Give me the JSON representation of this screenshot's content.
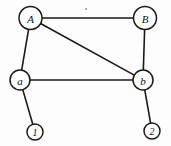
{
  "figure": {
    "background_color": "#fdfdfd",
    "stroke_color": "#1a1a1a",
    "width": 171,
    "height": 146
  },
  "graph_data": {
    "type": "node-link-diagram",
    "directed": false,
    "nodes": [
      {
        "id": "A",
        "label": "A",
        "cx": 30.5,
        "cy": 18,
        "r": 11.5,
        "size": "major"
      },
      {
        "id": "B",
        "label": "B",
        "cx": 145,
        "cy": 18,
        "r": 11.5,
        "size": "major"
      },
      {
        "id": "a",
        "label": "a",
        "cx": 20,
        "cy": 80,
        "r": 10,
        "size": "major"
      },
      {
        "id": "b",
        "label": "b",
        "cx": 143,
        "cy": 80,
        "r": 10,
        "size": "major"
      },
      {
        "id": "1",
        "label": "1",
        "cx": 35,
        "cy": 132,
        "r": 8,
        "size": "minor"
      },
      {
        "id": "2",
        "label": "2",
        "cx": 152,
        "cy": 131,
        "r": 8,
        "size": "minor"
      }
    ],
    "edges": [
      {
        "source": "A",
        "target": "B",
        "name": "edge-A-B"
      },
      {
        "source": "A",
        "target": "a",
        "name": "edge-A-a"
      },
      {
        "source": "A",
        "target": "b",
        "name": "edge-A-b"
      },
      {
        "source": "B",
        "target": "b",
        "name": "edge-B-b"
      },
      {
        "source": "a",
        "target": "b",
        "name": "edge-a-b"
      },
      {
        "source": "a",
        "target": "1",
        "name": "edge-a-1"
      },
      {
        "source": "b",
        "target": "2",
        "name": "edge-b-2"
      }
    ],
    "artifacts": [
      {
        "name": "scan-speck",
        "cx": 86,
        "cy": 9,
        "r": 0.9
      }
    ]
  }
}
